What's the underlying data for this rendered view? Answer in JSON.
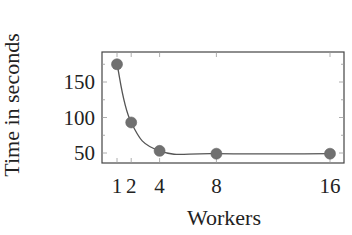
{
  "chart_data": {
    "type": "line",
    "title": "",
    "xlabel": "Workers",
    "ylabel": "Time in seconds",
    "x": [
      1,
      2,
      4,
      8,
      16
    ],
    "series": [
      {
        "name": "Time",
        "values": [
          175,
          93,
          53,
          49,
          49
        ],
        "color": "#555555",
        "marker": "circle",
        "marker_color": "#707070",
        "smooth": true
      }
    ],
    "x_ticks": [
      1,
      2,
      4,
      8,
      16
    ],
    "x_tick_labels": [
      "1",
      "2",
      "4",
      "8",
      "16"
    ],
    "y_ticks": [
      50,
      100,
      150
    ],
    "y_tick_labels": [
      "50",
      "100",
      "150"
    ],
    "xlim": [
      0.2,
      16.9
    ],
    "ylim": [
      36,
      194
    ],
    "grid": false,
    "legend": null
  }
}
